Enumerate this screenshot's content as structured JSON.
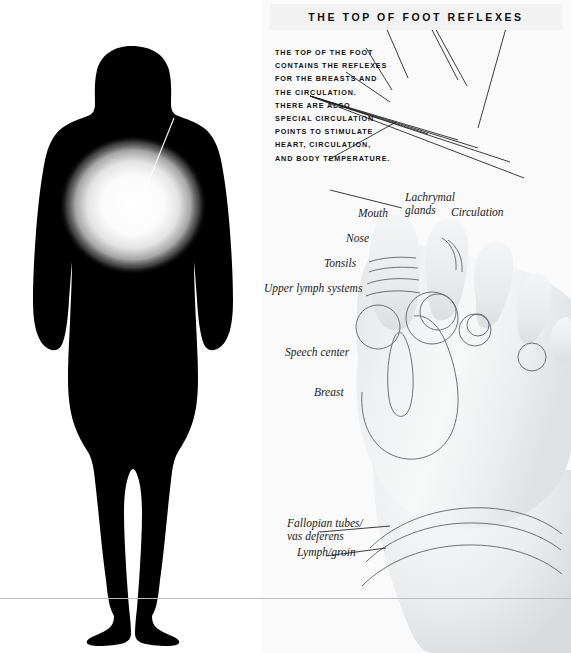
{
  "header": {
    "title": "THE TOP OF FOOT REFLEXES"
  },
  "intro": {
    "lines": [
      "THE TOP OF THE FOOT",
      "CONTAINS THE REFLEXES",
      "FOR THE BREASTS AND",
      "THE CIRCULATION.",
      "THERE ARE ALSO",
      "SPECIAL CIRCULATION",
      "POINTS TO STIMULATE",
      "HEART, CIRCULATION,",
      "AND BODY TEMPERATURE."
    ]
  },
  "body_figure": {
    "label": "Breasts",
    "silhouette_color": "#000000",
    "highlight_color": "#ffffff",
    "background_color": "#ffffff"
  },
  "foot_figure": {
    "background_color": "#fafafa",
    "outline_color": "#555f66",
    "leader_color": "#1a1a1a",
    "labels": [
      {
        "id": "mouth",
        "text": "Mouth"
      },
      {
        "id": "lachrymal-glands",
        "text": "Lachrymal\nglands",
        "line1": "Lachrymal",
        "line2": "glands"
      },
      {
        "id": "circulation",
        "text": "Circulation"
      },
      {
        "id": "nose",
        "text": "Nose"
      },
      {
        "id": "tonsils",
        "text": "Tonsils"
      },
      {
        "id": "upper-lymph-systems",
        "text": "Upper lymph systems"
      },
      {
        "id": "speech-center",
        "text": "Speech center"
      },
      {
        "id": "breast",
        "text": "Breast"
      },
      {
        "id": "fallopian-tubes",
        "text": "Fallopian tubes/\nvas deferens",
        "line1": "Fallopian tubes/",
        "line2": "vas deferens"
      },
      {
        "id": "lymph-groin",
        "text": "Lymph/groin"
      }
    ]
  }
}
